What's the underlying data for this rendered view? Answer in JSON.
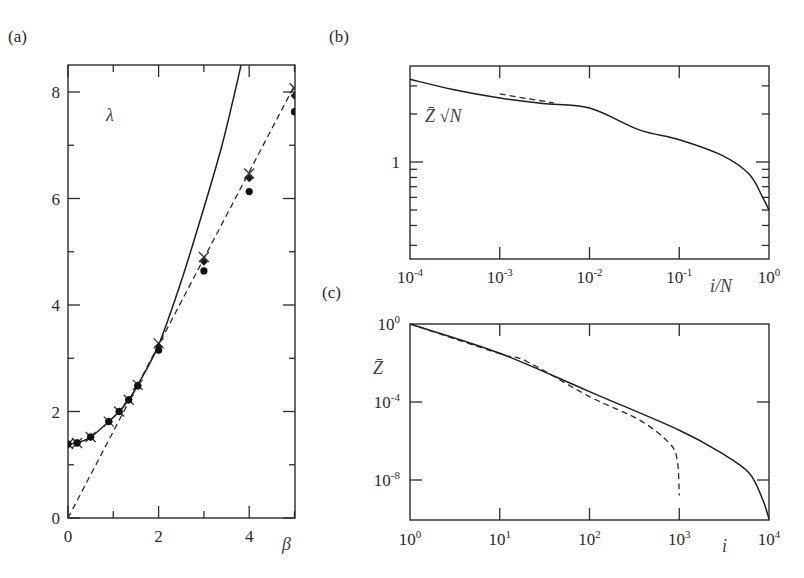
{
  "figure": {
    "panel_labels": [
      "(a)",
      "(b)",
      "(c)"
    ]
  },
  "chart_data": [
    {
      "panel": "(a)",
      "type": "line",
      "title": "",
      "xlabel": "β",
      "ylabel": "λ",
      "xlim": [
        0,
        5
      ],
      "ylim": [
        0,
        8.5
      ],
      "xticks": [
        0,
        2,
        4
      ],
      "xminor": [
        1,
        3,
        5
      ],
      "yticks": [
        0,
        2,
        4,
        6,
        8
      ],
      "yminor": [
        1,
        3,
        5,
        7
      ],
      "grid": false,
      "series": [
        {
          "name": "solid curve",
          "style": "solid",
          "x": [
            0,
            0.2,
            0.5,
            0.9,
            1.13,
            1.34,
            1.54,
            2.0,
            2.5,
            2.92,
            3.4,
            3.82
          ],
          "y": [
            1.39,
            1.41,
            1.52,
            1.81,
            2.0,
            2.22,
            2.5,
            3.25,
            4.45,
            5.6,
            7.0,
            8.5
          ]
        },
        {
          "name": "dashed line",
          "style": "dashed",
          "x": [
            0,
            5.2
          ],
          "y": [
            0,
            8.45
          ]
        },
        {
          "name": "crosses",
          "marker": "x",
          "x": [
            0,
            0.2,
            0.5,
            0.9,
            1.13,
            1.34,
            1.54,
            2.0,
            3.0,
            4.0,
            5.0
          ],
          "y": [
            1.39,
            1.41,
            1.52,
            1.81,
            2.0,
            2.22,
            2.5,
            3.28,
            4.9,
            6.47,
            8.07
          ]
        },
        {
          "name": "diamonds",
          "marker": "diamond",
          "x": [
            0,
            0.2,
            0.5,
            0.9,
            1.13,
            1.34,
            1.54,
            2.0,
            3.0,
            4.0,
            5.0
          ],
          "y": [
            1.39,
            1.41,
            1.52,
            1.81,
            2.0,
            2.22,
            2.49,
            3.22,
            4.81,
            6.38,
            7.93
          ]
        },
        {
          "name": "dots",
          "marker": "circle",
          "x": [
            0,
            0.2,
            0.5,
            0.9,
            1.13,
            1.34,
            1.54,
            2.0,
            3.0,
            4.0,
            5.0
          ],
          "y": [
            1.39,
            1.41,
            1.52,
            1.81,
            2.0,
            2.22,
            2.48,
            3.15,
            4.64,
            6.13,
            7.63
          ]
        }
      ]
    },
    {
      "panel": "(b)",
      "type": "line",
      "title": "",
      "xlabel": "i/N",
      "ylabel": "",
      "annotation": "Z̄ √N",
      "xscale": "log",
      "yscale": "log",
      "xlim": [
        0.0001,
        1
      ],
      "ylim": [
        0.25,
        4
      ],
      "xticks": [
        "10^-4",
        "10^-3",
        "10^-2",
        "10^-1",
        "10^0"
      ],
      "yticks": [
        "1"
      ],
      "yminor": [
        0.3,
        0.4,
        0.5,
        0.6,
        0.7,
        0.8,
        0.9,
        2,
        3
      ],
      "grid": false,
      "series": [
        {
          "name": "solid",
          "style": "solid",
          "x": [
            0.0001,
            0.0003,
            0.001,
            0.003,
            0.01,
            0.036,
            0.1,
            0.3,
            0.6,
            0.85,
            1.0
          ],
          "y": [
            3.3,
            2.85,
            2.52,
            2.33,
            2.18,
            1.59,
            1.38,
            1.1,
            0.84,
            0.6,
            0.5
          ]
        },
        {
          "name": "dashed",
          "style": "dashed",
          "x": [
            0.001,
            0.002,
            0.004
          ],
          "y": [
            2.67,
            2.5,
            2.35
          ]
        }
      ]
    },
    {
      "panel": "(c)",
      "type": "line",
      "title": "",
      "xlabel": "i",
      "ylabel": "Z̄",
      "xscale": "log",
      "yscale": "log",
      "xlim": [
        1,
        10000
      ],
      "ylim": [
        1e-10,
        1
      ],
      "xticks": [
        "10^0",
        "10^1",
        "10^2",
        "10^3",
        "10^4"
      ],
      "yticks": [
        "10^0",
        "10^-4",
        "10^-8"
      ],
      "grid": false,
      "series": [
        {
          "name": "solid",
          "style": "solid",
          "x": [
            1,
            10,
            100,
            1000,
            2900,
            6000,
            8500,
            10000
          ],
          "y": [
            1,
            0.0316,
            0.00034,
            3.6e-06,
            2.5e-07,
            2.3e-08,
            1e-09,
            1e-10
          ]
        },
        {
          "name": "dashed",
          "style": "dashed",
          "x": [
            1,
            10,
            20,
            100,
            360,
            770,
            950,
            1000
          ],
          "y": [
            1,
            0.03,
            0.012,
            0.00019,
            1.2e-05,
            8e-07,
            1e-07,
            1.6e-09
          ]
        }
      ]
    }
  ]
}
